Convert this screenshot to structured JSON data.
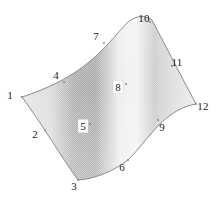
{
  "figure": {
    "type": "surface-patch-diagram",
    "width": 219,
    "height": 198,
    "background_color": "#ffffff",
    "outline_color": "#8c8c8c",
    "label_color": "#1a1a1a"
  },
  "shading": {
    "style": "halftone-grayscale-horizontal-gradient",
    "stops": [
      {
        "offset": "0%",
        "color": "#e4e4e4"
      },
      {
        "offset": "16%",
        "color": "#dcdcdc"
      },
      {
        "offset": "30%",
        "color": "#ababab"
      },
      {
        "offset": "42%",
        "color": "#a6a6a6"
      },
      {
        "offset": "56%",
        "color": "#ededed"
      },
      {
        "offset": "66%",
        "color": "#f2f2f2"
      },
      {
        "offset": "76%",
        "color": "#c9c9c9"
      },
      {
        "offset": "86%",
        "color": "#dadada"
      },
      {
        "offset": "100%",
        "color": "#ececec"
      }
    ],
    "darkest_color": "#a6a6a6",
    "lightest_color": "#f2f2f2"
  },
  "patch": {
    "outline_path": "M 22,97 C 46,89 72,78 96,56 C 110,43 118,32 128,22 C 138,14 146,16 152,20 C 162,39 178,70 196,104 C 184,106 172,112 160,124 C 150,134 138,150 128,160 C 112,172 94,179 78,180 C 62,158 42,124 22,97 Z",
    "edges": [
      {
        "name": "edge-1-to-7-to-10",
        "from": 1,
        "to": 10,
        "shape": "concave-up-arc-then-crest"
      },
      {
        "name": "edge-10-to-12",
        "from": 10,
        "to": 12,
        "shape": "near-straight"
      },
      {
        "name": "edge-12-to-9-to-6-to-3",
        "from": 12,
        "to": 3,
        "shape": "concave-up-arc"
      },
      {
        "name": "edge-3-to-1",
        "from": 3,
        "to": 1,
        "shape": "near-straight"
      }
    ]
  },
  "points": [
    {
      "id": 1,
      "label": "1",
      "x": 10,
      "y": 95,
      "boxed": false,
      "vertex_x": 22,
      "vertex_y": 97
    },
    {
      "id": 2,
      "label": "2",
      "x": 35,
      "y": 134,
      "boxed": false,
      "vertex_x": 45,
      "vertex_y": 130
    },
    {
      "id": 3,
      "label": "3",
      "x": 74,
      "y": 186,
      "boxed": false,
      "vertex_x": 78,
      "vertex_y": 180
    },
    {
      "id": 4,
      "label": "4",
      "x": 56,
      "y": 75,
      "boxed": false,
      "vertex_x": 64,
      "vertex_y": 82
    },
    {
      "id": 5,
      "label": "5",
      "x": 83,
      "y": 126,
      "boxed": true,
      "vertex_x": 90,
      "vertex_y": 124
    },
    {
      "id": 6,
      "label": "6",
      "x": 122,
      "y": 167,
      "boxed": false,
      "vertex_x": 128,
      "vertex_y": 160
    },
    {
      "id": 7,
      "label": "7",
      "x": 96,
      "y": 36,
      "boxed": false,
      "vertex_x": 104,
      "vertex_y": 43
    },
    {
      "id": 8,
      "label": "8",
      "x": 118,
      "y": 87,
      "boxed": true,
      "vertex_x": 126,
      "vertex_y": 84
    },
    {
      "id": 9,
      "label": "9",
      "x": 162,
      "y": 127,
      "boxed": false,
      "vertex_x": 158,
      "vertex_y": 120
    },
    {
      "id": 10,
      "label": "10",
      "x": 144,
      "y": 18,
      "boxed": false,
      "vertex_x": 150,
      "vertex_y": 22
    },
    {
      "id": 11,
      "label": "11",
      "x": 177,
      "y": 62,
      "boxed": false,
      "vertex_x": 172,
      "vertex_y": 66
    },
    {
      "id": 12,
      "label": "12",
      "x": 203,
      "y": 106,
      "boxed": false,
      "vertex_x": 196,
      "vertex_y": 104
    }
  ]
}
